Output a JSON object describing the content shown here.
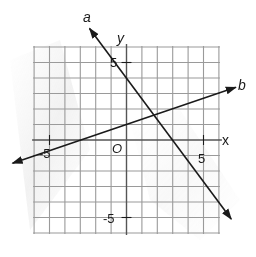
{
  "chart_data": {
    "type": "line",
    "title": "",
    "xlabel": "x",
    "ylabel": "y",
    "origin_label": "O",
    "xlim": [
      -6,
      6
    ],
    "ylim": [
      -6,
      6
    ],
    "grid": true,
    "grid_step": 1,
    "tick_labels": {
      "x": [
        {
          "value": -5,
          "label": "-5"
        },
        {
          "value": 5,
          "label": "5"
        }
      ],
      "y": [
        {
          "value": 5,
          "label": "5"
        },
        {
          "value": -5,
          "label": "-5"
        }
      ]
    },
    "series": [
      {
        "name": "a",
        "equation": "y = -4/3 x + 4",
        "slope": -1.3333,
        "intercept": 4,
        "points": [
          [
            -2.4,
            7.2
          ],
          [
            0,
            4
          ],
          [
            3,
            0
          ],
          [
            6.8,
            -5.1
          ]
        ],
        "arrows": "both"
      },
      {
        "name": "b",
        "equation": "y = 1/3 x + 1",
        "slope": 0.3333,
        "intercept": 1,
        "points": [
          [
            -7.4,
            -1.5
          ],
          [
            0,
            1
          ],
          [
            3,
            2
          ],
          [
            7.1,
            3.4
          ]
        ],
        "arrows": "both"
      }
    ],
    "intersection": {
      "x": 1.8,
      "y": 1.6
    }
  },
  "colors": {
    "grid": "#9a9a9a",
    "axis": "#555555",
    "line": "#1a1a1a",
    "background": "#ffffff"
  }
}
